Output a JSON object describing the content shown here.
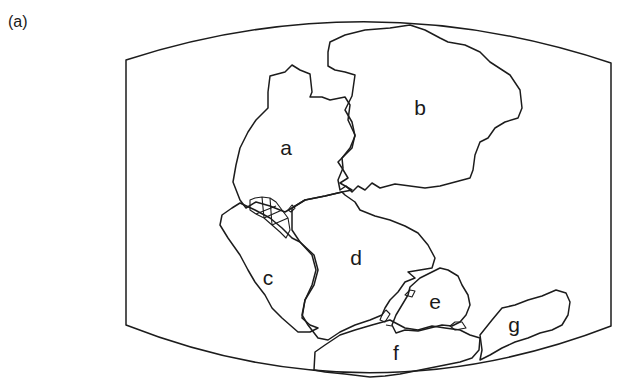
{
  "figure": {
    "panel_label": "(a)",
    "type": "paleogeographic reconstruction map",
    "continent_labels": {
      "a": "a",
      "b": "b",
      "c": "c",
      "d": "d",
      "e": "e",
      "f": "f",
      "g": "g"
    },
    "colors": {
      "line": "#1c1c1c",
      "background": "#ffffff"
    }
  }
}
